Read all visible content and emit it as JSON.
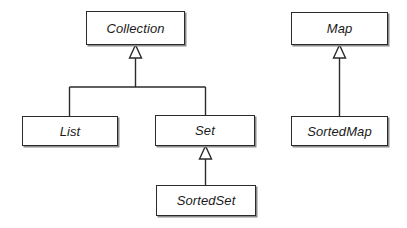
{
  "diagram": {
    "type": "uml-class-diagram",
    "notation": "generalization",
    "background_color": "#ffffff",
    "line_color": "#2b2b2b",
    "text_color": "#1a1a1a",
    "shadow_color": "#8c8c8c",
    "nodes": [
      {
        "id": "collection",
        "label": "Collection",
        "stereotype": "interface",
        "style": "italic",
        "x": 86,
        "y": 11,
        "width": 99,
        "height": 34
      },
      {
        "id": "list",
        "label": "List",
        "stereotype": "interface",
        "style": "italic",
        "x": 22,
        "y": 116,
        "width": 96,
        "height": 30
      },
      {
        "id": "set",
        "label": "Set",
        "stereotype": "interface",
        "style": "italic",
        "x": 155,
        "y": 115,
        "width": 100,
        "height": 31
      },
      {
        "id": "sortedset",
        "label": "SortedSet",
        "stereotype": "interface",
        "style": "italic",
        "x": 156,
        "y": 185,
        "width": 100,
        "height": 31
      },
      {
        "id": "map",
        "label": "Map",
        "stereotype": "interface",
        "style": "italic",
        "x": 291,
        "y": 12,
        "width": 97,
        "height": 33
      },
      {
        "id": "sortedmap",
        "label": "SortedMap",
        "stereotype": "interface",
        "style": "italic",
        "x": 291,
        "y": 116,
        "width": 97,
        "height": 30
      }
    ],
    "edges": [
      {
        "id": "list-extends-collection",
        "from": "list",
        "to": "collection",
        "kind": "generalization",
        "arrow": "hollow-triangle"
      },
      {
        "id": "set-extends-collection",
        "from": "set",
        "to": "collection",
        "kind": "generalization",
        "arrow": "hollow-triangle"
      },
      {
        "id": "sortedset-extends-set",
        "from": "sortedset",
        "to": "set",
        "kind": "generalization",
        "arrow": "hollow-triangle"
      },
      {
        "id": "sortedmap-extends-map",
        "from": "sortedmap",
        "to": "map",
        "kind": "generalization",
        "arrow": "hollow-triangle"
      }
    ]
  }
}
